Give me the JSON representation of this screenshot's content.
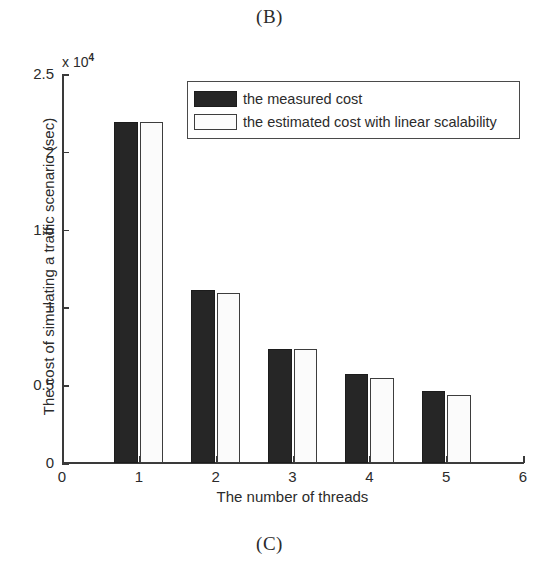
{
  "figure": {
    "panel_label_top": "(B)",
    "panel_label_bottom": "(C)"
  },
  "chart_data": {
    "type": "bar",
    "title": "",
    "subtitle": "",
    "xlabel": "The number of threads",
    "ylabel": "The cost of simulating a traffic scenario (sec)",
    "y_multiplier_text": "x 10",
    "y_multiplier_exponent": "4",
    "y_multiplier_value": 10000,
    "categories": [
      "1",
      "2",
      "3",
      "4",
      "5"
    ],
    "x": [
      1,
      2,
      3,
      4,
      5
    ],
    "xlim": [
      0,
      6
    ],
    "ylim": [
      0,
      25000
    ],
    "xticks": [
      "0",
      "1",
      "2",
      "3",
      "4",
      "5",
      "6"
    ],
    "yticks": [
      "0",
      "0.5",
      "1",
      "1.5",
      "2",
      "2.5"
    ],
    "ytick_values": [
      0,
      5000,
      10000,
      15000,
      20000,
      25000
    ],
    "grid": false,
    "legend_position": "top-right inside",
    "series": [
      {
        "name": "the measured cost",
        "color": "#262626",
        "values": [
          21900,
          11100,
          7300,
          5750,
          4600
        ]
      },
      {
        "name": "the estimated cost with linear scalability",
        "color": "#fbfbfb",
        "edge_color": "#3d3d3d",
        "values": [
          21900,
          10950,
          7300,
          5450,
          4350
        ]
      }
    ]
  },
  "legend": {
    "items": [
      {
        "label": "the measured cost"
      },
      {
        "label": "the estimated cost with linear scalability"
      }
    ]
  }
}
